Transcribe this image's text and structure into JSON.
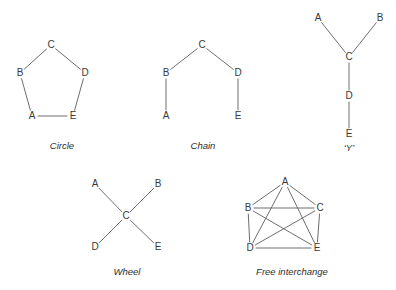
{
  "figure": {
    "background_color": "#ffffff",
    "edge_color": "#6e6e6e",
    "label_color": "#3a3a3a",
    "caption_color": "#2e2e2e",
    "diagrams": [
      {
        "id": "circle",
        "caption": "Circle",
        "caption_pos": {
          "x": 62,
          "y": 146
        },
        "nodes": [
          {
            "label": "A",
            "x": 32,
            "y": 116
          },
          {
            "label": "B",
            "x": 20,
            "y": 73
          },
          {
            "label": "C",
            "x": 51,
            "y": 45
          },
          {
            "label": "D",
            "x": 85,
            "y": 73
          },
          {
            "label": "E",
            "x": 73,
            "y": 116
          }
        ],
        "edges": [
          [
            "A",
            "B"
          ],
          [
            "B",
            "C"
          ],
          [
            "C",
            "D"
          ],
          [
            "D",
            "E"
          ],
          [
            "E",
            "A"
          ]
        ]
      },
      {
        "id": "chain",
        "caption": "Chain",
        "caption_pos": {
          "x": 203,
          "y": 146
        },
        "nodes": [
          {
            "label": "A",
            "x": 166,
            "y": 116
          },
          {
            "label": "B",
            "x": 166,
            "y": 73
          },
          {
            "label": "C",
            "x": 202,
            "y": 45
          },
          {
            "label": "D",
            "x": 238,
            "y": 73
          },
          {
            "label": "E",
            "x": 238,
            "y": 116
          }
        ],
        "edges": [
          [
            "A",
            "B"
          ],
          [
            "B",
            "C"
          ],
          [
            "C",
            "D"
          ],
          [
            "D",
            "E"
          ]
        ]
      },
      {
        "id": "y-shape",
        "caption": "‘Y’",
        "caption_pos": {
          "x": 349,
          "y": 148
        },
        "nodes": [
          {
            "label": "A",
            "x": 318,
            "y": 18
          },
          {
            "label": "B",
            "x": 380,
            "y": 18
          },
          {
            "label": "C",
            "x": 349,
            "y": 57
          },
          {
            "label": "D",
            "x": 349,
            "y": 96
          },
          {
            "label": "E",
            "x": 349,
            "y": 134
          }
        ],
        "edges": [
          [
            "A",
            "C"
          ],
          [
            "B",
            "C"
          ],
          [
            "C",
            "D"
          ],
          [
            "D",
            "E"
          ]
        ]
      },
      {
        "id": "wheel",
        "caption": "Wheel",
        "caption_pos": {
          "x": 127,
          "y": 272
        },
        "nodes": [
          {
            "label": "A",
            "x": 95,
            "y": 184
          },
          {
            "label": "B",
            "x": 158,
            "y": 184
          },
          {
            "label": "C",
            "x": 126,
            "y": 216
          },
          {
            "label": "D",
            "x": 95,
            "y": 247
          },
          {
            "label": "E",
            "x": 158,
            "y": 247
          }
        ],
        "edges": [
          [
            "A",
            "C"
          ],
          [
            "B",
            "C"
          ],
          [
            "C",
            "D"
          ],
          [
            "C",
            "E"
          ]
        ]
      },
      {
        "id": "free-interchange",
        "caption": "Free interchange",
        "caption_pos": {
          "x": 292,
          "y": 272
        },
        "nodes": [
          {
            "label": "A",
            "x": 285,
            "y": 182
          },
          {
            "label": "B",
            "x": 248,
            "y": 208
          },
          {
            "label": "C",
            "x": 320,
            "y": 208
          },
          {
            "label": "D",
            "x": 250,
            "y": 248
          },
          {
            "label": "E",
            "x": 317,
            "y": 248
          }
        ],
        "edges": [
          [
            "A",
            "B"
          ],
          [
            "A",
            "C"
          ],
          [
            "A",
            "D"
          ],
          [
            "A",
            "E"
          ],
          [
            "B",
            "C"
          ],
          [
            "B",
            "D"
          ],
          [
            "B",
            "E"
          ],
          [
            "C",
            "D"
          ],
          [
            "C",
            "E"
          ],
          [
            "D",
            "E"
          ]
        ]
      }
    ]
  }
}
